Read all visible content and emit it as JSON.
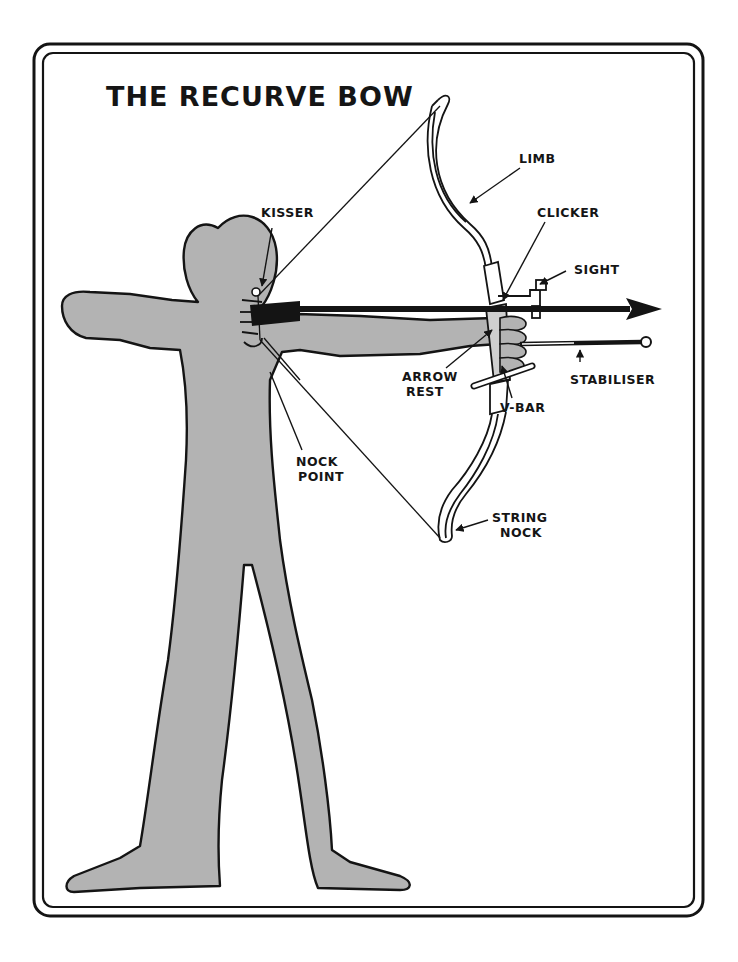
{
  "title": "THE RECURVE BOW",
  "colors": {
    "ink": "#141414",
    "figure_fill": "#b3b3b3",
    "background": "#ffffff"
  },
  "labels": {
    "limb": "LIMB",
    "kisser": "KISSER",
    "clicker": "CLICKER",
    "sight": "SIGHT",
    "arrow_rest_line1": "ARROW",
    "arrow_rest_line2": "REST",
    "v_bar": "V-BAR",
    "stabiliser": "STABILISER",
    "nock_point_line1": "NOCK",
    "nock_point_line2": "POINT",
    "string_nock_line1": "STRING",
    "string_nock_line2": "NOCK"
  }
}
